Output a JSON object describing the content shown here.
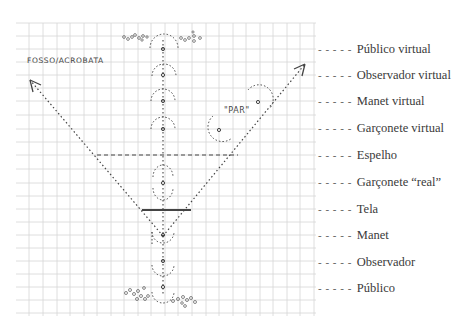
{
  "diagram": {
    "handwritten_labels": {
      "top_left": "FOSSO/ACROBATA",
      "par": "\"PAR\""
    },
    "legend": [
      {
        "dash": "- - - - -",
        "label": "Público virtual",
        "y": 49
      },
      {
        "dash": "- - - - -",
        "label": "Observador virtual",
        "y": 75
      },
      {
        "dash": "- - - - -",
        "label": "Manet virtual",
        "y": 101
      },
      {
        "dash": "- - - - -",
        "label": "Garçonete virtual",
        "y": 129
      },
      {
        "dash": "- - - - -",
        "label": "Espelho",
        "y": 155
      },
      {
        "dash": "- - - - -",
        "label": "Garçonete “real”",
        "y": 183
      },
      {
        "dash": "- - - - -",
        "label": "Tela",
        "y": 209
      },
      {
        "dash": "- - - - -",
        "label": "Manet",
        "y": 235
      },
      {
        "dash": "- - - - -",
        "label": "Observador",
        "y": 261
      },
      {
        "dash": "- - - - -",
        "label": "Público",
        "y": 287
      }
    ],
    "colors": {
      "grid": "#d4d4d4",
      "ink": "#444444",
      "text": "#3a3a3a"
    }
  }
}
